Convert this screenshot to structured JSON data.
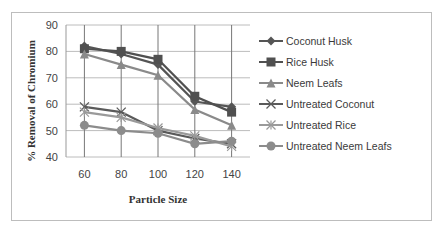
{
  "chart_data": {
    "type": "line",
    "title": "",
    "xlabel": "Particle Size",
    "ylabel": "% Removal of Chromium",
    "x": [
      60,
      80,
      100,
      120,
      140
    ],
    "ylim": [
      40,
      90
    ],
    "yticks": [
      40,
      50,
      60,
      70,
      80,
      90
    ],
    "grid": true,
    "legend_position": "right",
    "series": [
      {
        "name": "Coconut Husk",
        "marker": "diamond",
        "color": "#555555",
        "values": [
          82,
          79,
          75,
          61,
          59
        ]
      },
      {
        "name": "Rice Husk",
        "marker": "square",
        "color": "#505050",
        "values": [
          81,
          80,
          77,
          63,
          57
        ]
      },
      {
        "name": "Neem Leafs",
        "marker": "triangle",
        "color": "#8a8a8a",
        "values": [
          79,
          75,
          71,
          58,
          52
        ]
      },
      {
        "name": "Untreated Coconut",
        "marker": "x",
        "color": "#5a5a5a",
        "values": [
          59,
          57,
          50,
          47,
          45
        ]
      },
      {
        "name": "Untreated Rice",
        "marker": "star",
        "color": "#9a9a9a",
        "values": [
          57,
          55,
          51,
          48,
          44
        ]
      },
      {
        "name": "Untreated Neem Leafs",
        "marker": "circle",
        "color": "#8c8c8c",
        "values": [
          52,
          50,
          49,
          45,
          46
        ]
      }
    ]
  }
}
